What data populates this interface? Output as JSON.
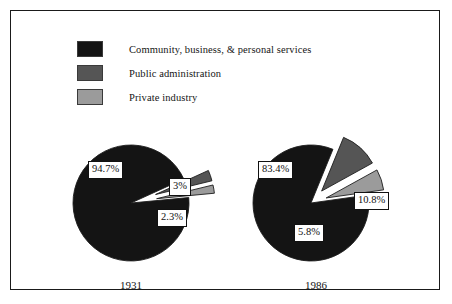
{
  "figure": {
    "background_color": "#ffffff",
    "frame_color": "#1a1a1a"
  },
  "legend": {
    "items": [
      {
        "label": "Community, business, & personal services",
        "color": "#141414",
        "swatch_name": "legend-swatch-community"
      },
      {
        "label": "Public administration",
        "color": "#555555",
        "swatch_name": "legend-swatch-public-administration"
      },
      {
        "label": "Private industry",
        "color": "#9b9b9b",
        "swatch_name": "legend-swatch-private-industry"
      }
    ]
  },
  "charts": [
    {
      "year": "1931",
      "labels": [
        "94.7%",
        "3%",
        "2.3%"
      ]
    },
    {
      "year": "1986",
      "labels": [
        "83.4%",
        "10.8%",
        "5.8%"
      ]
    }
  ],
  "chart_data": {
    "type": "pie",
    "title": "",
    "subtitle": "",
    "xlabel": "",
    "ylabel": "",
    "legend_position": "top-left",
    "grid": false,
    "categories": [
      "Community, business, & personal services",
      "Public administration",
      "Private industry"
    ],
    "colors": [
      "#141414",
      "#555555",
      "#9b9b9b"
    ],
    "charts": [
      {
        "name": "1931",
        "year": 1931,
        "slices": [
          {
            "category": "Community, business, & personal services",
            "value": 94.7,
            "label": "94.7%",
            "exploded": false
          },
          {
            "category": "Public administration",
            "value": 3.0,
            "label": "3%",
            "exploded": true
          },
          {
            "category": "Private industry",
            "value": 2.3,
            "label": "2.3%",
            "exploded": true
          }
        ]
      },
      {
        "name": "1986",
        "year": 1986,
        "slices": [
          {
            "category": "Community, business, & personal services",
            "value": 83.4,
            "label": "83.4%",
            "exploded": false
          },
          {
            "category": "Public administration",
            "value": 10.8,
            "label": "10.8%",
            "exploded": true
          },
          {
            "category": "Private industry",
            "value": 5.8,
            "label": "5.8%",
            "exploded": true
          }
        ]
      }
    ]
  }
}
